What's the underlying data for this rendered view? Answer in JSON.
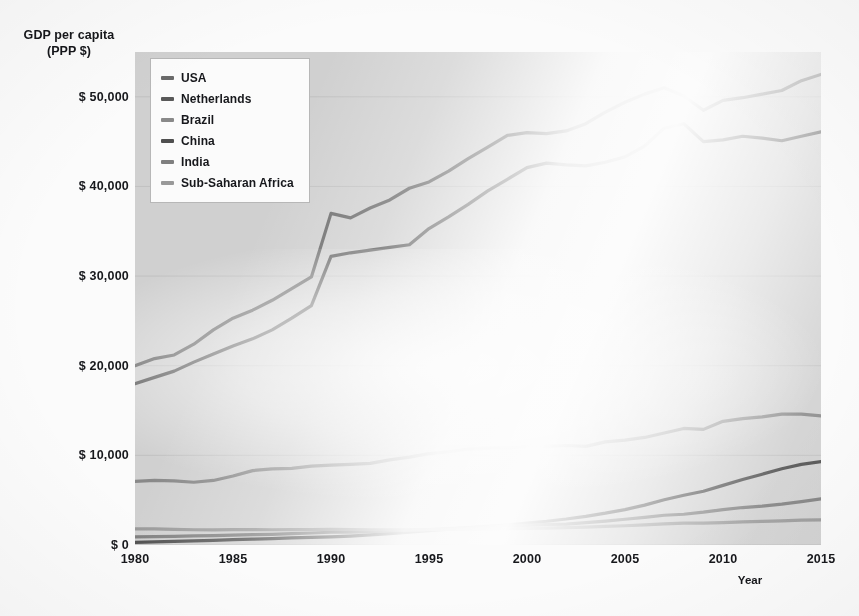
{
  "chart_data": {
    "type": "line",
    "title": "",
    "ylabel": "GDP per capita\n(PPP $)",
    "ylabel_line1": "GDP per capita",
    "ylabel_line2": "(PPP $)",
    "xlabel": "Year",
    "xlim": [
      1980,
      2015
    ],
    "ylim": [
      0,
      55000
    ],
    "grid": true,
    "legend_position": "top-left",
    "xticks": [
      1980,
      1985,
      1990,
      1995,
      2000,
      2005,
      2010,
      2015
    ],
    "xtick_labels": [
      "1980",
      "1985",
      "1990",
      "1995",
      "2000",
      "2005",
      "2010",
      "2015"
    ],
    "yticks": [
      0,
      10000,
      20000,
      30000,
      40000,
      50000
    ],
    "ytick_labels": [
      "$ 0",
      "$ 10,000",
      "$ 20,000",
      "$ 30,000",
      "$ 40,000",
      "$ 50,000"
    ],
    "x": [
      1980,
      1981,
      1982,
      1983,
      1984,
      1985,
      1986,
      1987,
      1988,
      1989,
      1990,
      1991,
      1992,
      1993,
      1994,
      1995,
      1996,
      1997,
      1998,
      1999,
      2000,
      2001,
      2002,
      2003,
      2004,
      2005,
      2006,
      2007,
      2008,
      2009,
      2010,
      2011,
      2012,
      2013,
      2014,
      2015
    ],
    "series": [
      {
        "name": "USA",
        "color": "#6b6b6b",
        "values": [
          20000,
          20800,
          21200,
          22400,
          24000,
          25300,
          26200,
          27300,
          28600,
          29900,
          37000,
          36500,
          37600,
          38500,
          39800,
          40500,
          41700,
          43100,
          44400,
          45700,
          46000,
          45900,
          46200,
          47000,
          48300,
          49400,
          50300,
          51000,
          50100,
          48500,
          49600,
          49900,
          50300,
          50700,
          51800,
          52500
        ]
      },
      {
        "name": "Netherlands",
        "color": "#5a5a5a",
        "values": [
          18000,
          18700,
          19400,
          20400,
          21300,
          22200,
          23000,
          24000,
          25300,
          26700,
          32200,
          32600,
          32900,
          33200,
          33500,
          35300,
          36600,
          38000,
          39500,
          40800,
          42100,
          42600,
          42400,
          42300,
          42700,
          43300,
          44500,
          46500,
          47000,
          45000,
          45200,
          45600,
          45400,
          45100,
          45600,
          46100
        ]
      },
      {
        "name": "Brazil",
        "color": "#8a8a8a",
        "values": [
          7100,
          7200,
          7150,
          7000,
          7200,
          7700,
          8300,
          8500,
          8550,
          8800,
          8900,
          9000,
          9100,
          9500,
          9800,
          10200,
          10400,
          10700,
          10800,
          10800,
          11000,
          11000,
          11100,
          11000,
          11500,
          11700,
          12000,
          12500,
          13000,
          12900,
          13800,
          14100,
          14300,
          14600,
          14600,
          14400
        ]
      },
      {
        "name": "China",
        "color": "#4f4f4f",
        "values": [
          300,
          350,
          400,
          450,
          520,
          600,
          650,
          720,
          800,
          840,
          900,
          990,
          1120,
          1270,
          1440,
          1600,
          1760,
          1930,
          2080,
          2250,
          2450,
          2650,
          2900,
          3200,
          3550,
          3950,
          4450,
          5050,
          5550,
          6000,
          6650,
          7300,
          7900,
          8500,
          9000,
          9300
        ]
      },
      {
        "name": "India",
        "color": "#808080",
        "values": [
          900,
          930,
          960,
          1010,
          1050,
          1100,
          1150,
          1190,
          1270,
          1340,
          1420,
          1440,
          1500,
          1560,
          1640,
          1730,
          1840,
          1910,
          2010,
          2120,
          2200,
          2290,
          2340,
          2500,
          2670,
          2870,
          3090,
          3320,
          3430,
          3660,
          3940,
          4180,
          4340,
          4560,
          4840,
          5150
        ]
      },
      {
        "name": "Sub-Saharan Africa",
        "color": "#9a9a9a",
        "values": [
          1800,
          1790,
          1750,
          1700,
          1690,
          1710,
          1710,
          1700,
          1720,
          1730,
          1740,
          1730,
          1700,
          1690,
          1690,
          1710,
          1750,
          1780,
          1790,
          1810,
          1850,
          1890,
          1930,
          1990,
          2070,
          2150,
          2250,
          2360,
          2450,
          2430,
          2500,
          2570,
          2630,
          2700,
          2770,
          2800
        ]
      }
    ]
  },
  "legend": {
    "items": [
      {
        "label": "USA"
      },
      {
        "label": "Netherlands"
      },
      {
        "label": "Brazil"
      },
      {
        "label": "China"
      },
      {
        "label": "India"
      },
      {
        "label": "Sub-Saharan Africa"
      }
    ]
  },
  "colors": {
    "plot_background": "#d2d2d2",
    "page_background": "#fdfdfd",
    "text": "#17181c",
    "gridline": "#bdbdbd",
    "legend_border": "#b9b9b9"
  }
}
